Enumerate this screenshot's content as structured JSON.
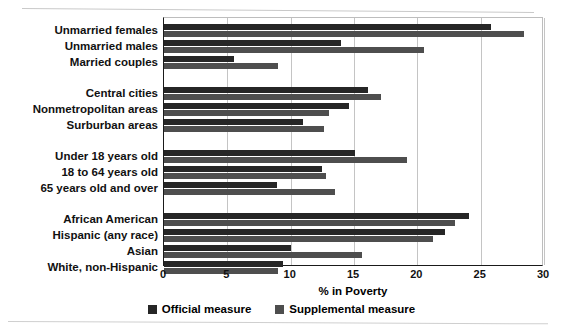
{
  "chart_data": {
    "type": "bar",
    "orientation": "horizontal",
    "title": "",
    "xlabel": "% in Poverty",
    "ylabel": "",
    "xlim": [
      0,
      30
    ],
    "xticks": [
      0,
      5,
      10,
      15,
      20,
      25,
      30
    ],
    "grid": "vertical",
    "legend_position": "bottom-center",
    "categories": [
      "Unmarried females",
      "Unmarried males",
      "Married couples",
      "Central cities",
      "Nonmetropolitan areas",
      "Surburban areas",
      "Under 18 years old",
      "18 to 64 years old",
      "65 years old and over",
      "African American",
      "Hispanic (any race)",
      "Asian",
      "White, non-Hispanic"
    ],
    "group_breaks_after": [
      "Married couples",
      "Surburban areas",
      "65 years old and over"
    ],
    "series": [
      {
        "name": "Official measure",
        "color": "#262626",
        "values": [
          25.8,
          14.0,
          5.5,
          16.1,
          14.6,
          11.0,
          15.1,
          12.5,
          8.9,
          24.1,
          22.2,
          10.0,
          9.4
        ]
      },
      {
        "name": "Supplemental measure",
        "color": "#4e4e4e",
        "values": [
          28.4,
          20.5,
          9.0,
          17.1,
          13.0,
          12.6,
          19.2,
          12.8,
          13.5,
          23.0,
          21.2,
          15.6,
          9.0
        ]
      }
    ]
  },
  "legend": {
    "items": [
      {
        "label": "Official measure",
        "color": "#262626",
        "swatch_name": "legend-swatch-official"
      },
      {
        "label": "Supplemental measure",
        "color": "#4e4e4e",
        "swatch_name": "legend-swatch-supplemental"
      }
    ]
  },
  "axis": {
    "x_title": "% in Poverty",
    "ticks": [
      "0",
      "5",
      "10",
      "15",
      "20",
      "25",
      "30"
    ]
  }
}
